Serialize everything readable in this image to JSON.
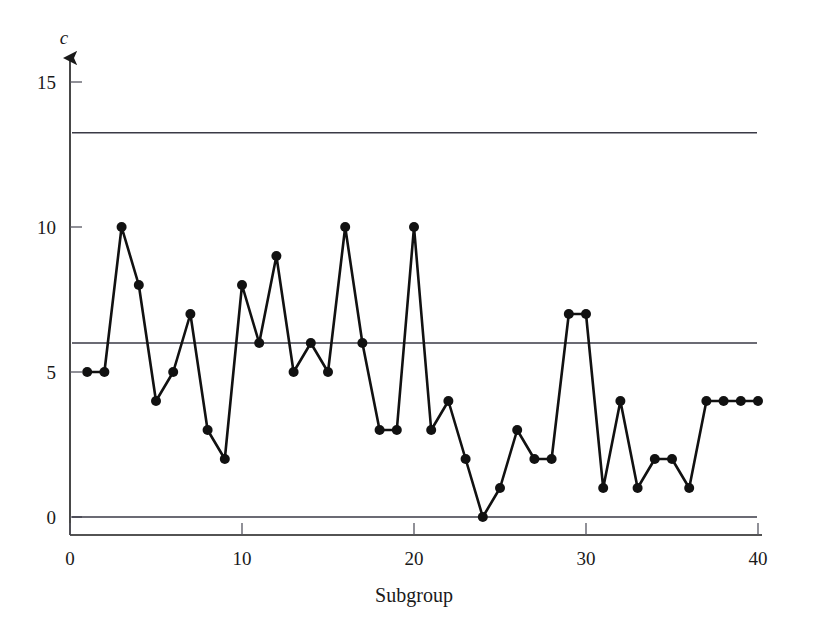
{
  "chart_data": {
    "type": "line",
    "title": "",
    "subtitle": "",
    "xlabel": "Subgroup",
    "ylabel": "c",
    "x": [
      1,
      2,
      3,
      4,
      5,
      6,
      7,
      8,
      9,
      10,
      11,
      12,
      13,
      14,
      15,
      16,
      17,
      18,
      19,
      20,
      21,
      22,
      23,
      24,
      25,
      26,
      27,
      28,
      29,
      30,
      31,
      32,
      33,
      34,
      35,
      36,
      37,
      38,
      39,
      40
    ],
    "values": [
      5,
      5,
      10,
      8,
      4,
      5,
      7,
      3,
      2,
      8,
      6,
      9,
      5,
      6,
      5,
      10,
      6,
      3,
      3,
      10,
      3,
      4,
      2,
      0,
      1,
      3,
      2,
      2,
      7,
      7,
      1,
      4,
      1,
      2,
      2,
      1,
      4,
      4,
      4,
      4
    ],
    "series": [
      {
        "name": "c",
        "values": [
          5,
          5,
          10,
          8,
          4,
          5,
          7,
          3,
          2,
          8,
          6,
          9,
          5,
          6,
          5,
          10,
          6,
          3,
          3,
          10,
          3,
          4,
          2,
          0,
          1,
          3,
          2,
          2,
          7,
          7,
          1,
          4,
          1,
          2,
          2,
          1,
          4,
          4,
          4,
          4
        ]
      }
    ],
    "xlim": [
      0,
      40
    ],
    "ylim": [
      0,
      16
    ],
    "xticks": [
      0,
      10,
      20,
      30,
      40
    ],
    "xtick_labels": [
      "0",
      "10",
      "20",
      "30",
      "40"
    ],
    "yticks": [
      0,
      5,
      10,
      15
    ],
    "ytick_labels": [
      "0",
      "5",
      "10",
      "15"
    ],
    "grid": false,
    "legend": "none",
    "marker": "filled-circle",
    "line_color": "#111111",
    "marker_color": "#111111",
    "limit_line_color": "#3a3a46",
    "reference_lines": [
      {
        "name": "upper-control-limit",
        "label": "UCL",
        "value": 13.25
      },
      {
        "name": "center-line",
        "label": "CL",
        "value": 6.0
      },
      {
        "name": "lower-control-limit",
        "label": "LCL",
        "value": 0.0
      }
    ]
  }
}
